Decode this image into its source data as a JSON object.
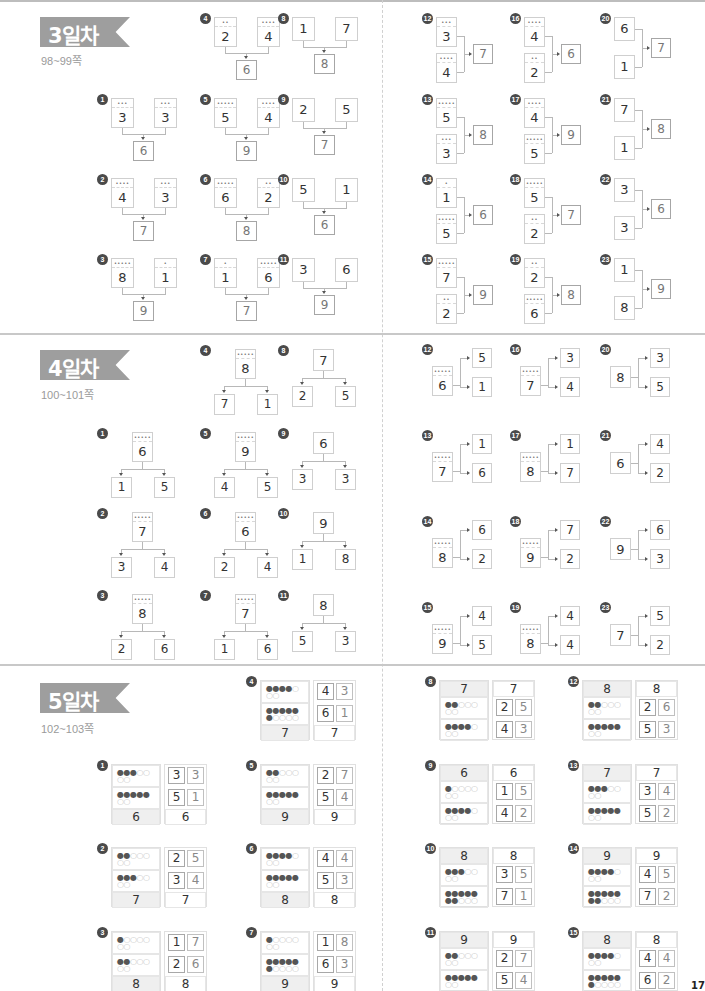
{
  "page": {
    "folio": "17"
  },
  "day3": {
    "title": "3일차",
    "pages": "98~99쪽",
    "problems": [
      {
        "n": "1",
        "a": 3,
        "b": 3,
        "sum": 6
      },
      {
        "n": "2",
        "a": 4,
        "b": 3,
        "sum": 7
      },
      {
        "n": "3",
        "a": 8,
        "b": 1,
        "sum": 9
      },
      {
        "n": "4",
        "a": 2,
        "b": 4,
        "sum": 6
      },
      {
        "n": "5",
        "a": 5,
        "b": 4,
        "sum": 9
      },
      {
        "n": "6",
        "a": 6,
        "b": 2,
        "sum": 8
      },
      {
        "n": "7",
        "a": 1,
        "b": 6,
        "sum": 7
      },
      {
        "n": "8",
        "a": 1,
        "b": 7,
        "sum": 8
      },
      {
        "n": "9",
        "a": 2,
        "b": 5,
        "sum": 7
      },
      {
        "n": "10",
        "a": 5,
        "b": 1,
        "sum": 6
      },
      {
        "n": "11",
        "a": 3,
        "b": 6,
        "sum": 9
      },
      {
        "n": "12",
        "a": 3,
        "b": 4,
        "sum": 7
      },
      {
        "n": "13",
        "a": 5,
        "b": 3,
        "sum": 8
      },
      {
        "n": "14",
        "a": 1,
        "b": 5,
        "sum": 6
      },
      {
        "n": "15",
        "a": 7,
        "b": 2,
        "sum": 9
      },
      {
        "n": "16",
        "a": 4,
        "b": 2,
        "sum": 6
      },
      {
        "n": "17",
        "a": 4,
        "b": 5,
        "sum": 9
      },
      {
        "n": "18",
        "a": 5,
        "b": 2,
        "sum": 7
      },
      {
        "n": "19",
        "a": 2,
        "b": 6,
        "sum": 8
      },
      {
        "n": "20",
        "a": 6,
        "b": 1,
        "sum": 7
      },
      {
        "n": "21",
        "a": 7,
        "b": 1,
        "sum": 8
      },
      {
        "n": "22",
        "a": 3,
        "b": 3,
        "sum": 6
      },
      {
        "n": "23",
        "a": 1,
        "b": 8,
        "sum": 9
      }
    ]
  },
  "day4": {
    "title": "4일차",
    "pages": "100~101쪽",
    "problems": [
      {
        "n": "1",
        "whole": 6,
        "a": 1,
        "b": 5
      },
      {
        "n": "2",
        "whole": 7,
        "a": 3,
        "b": 4
      },
      {
        "n": "3",
        "whole": 8,
        "a": 2,
        "b": 6
      },
      {
        "n": "4",
        "whole": 8,
        "a": 7,
        "b": 1
      },
      {
        "n": "5",
        "whole": 9,
        "a": 4,
        "b": 5
      },
      {
        "n": "6",
        "whole": 6,
        "a": 2,
        "b": 4
      },
      {
        "n": "7",
        "whole": 7,
        "a": 1,
        "b": 6
      },
      {
        "n": "8",
        "whole": 7,
        "a": 2,
        "b": 5
      },
      {
        "n": "9",
        "whole": 6,
        "a": 3,
        "b": 3
      },
      {
        "n": "10",
        "whole": 9,
        "a": 1,
        "b": 8
      },
      {
        "n": "11",
        "whole": 8,
        "a": 5,
        "b": 3
      },
      {
        "n": "12",
        "whole": 6,
        "a": 5,
        "b": 1
      },
      {
        "n": "13",
        "whole": 7,
        "a": 1,
        "b": 6
      },
      {
        "n": "14",
        "whole": 8,
        "a": 6,
        "b": 2
      },
      {
        "n": "15",
        "whole": 9,
        "a": 4,
        "b": 5
      },
      {
        "n": "16",
        "whole": 7,
        "a": 3,
        "b": 4
      },
      {
        "n": "17",
        "whole": 8,
        "a": 1,
        "b": 7
      },
      {
        "n": "18",
        "whole": 9,
        "a": 7,
        "b": 2
      },
      {
        "n": "19",
        "whole": 8,
        "a": 4,
        "b": 4
      },
      {
        "n": "20",
        "whole": 8,
        "a": 3,
        "b": 5
      },
      {
        "n": "21",
        "whole": 6,
        "a": 4,
        "b": 2
      },
      {
        "n": "22",
        "whole": 9,
        "a": 6,
        "b": 3
      },
      {
        "n": "23",
        "whole": 7,
        "a": 5,
        "b": 2
      }
    ]
  },
  "day5": {
    "title": "5일차",
    "pages": "102~103쪽",
    "problems": [
      {
        "n": "1",
        "total": 6,
        "rows": [
          {
            "filled": 3,
            "pair": [
              3,
              3
            ]
          },
          {
            "filled": 5,
            "pair": [
              5,
              1
            ]
          }
        ]
      },
      {
        "n": "2",
        "total": 7,
        "rows": [
          {
            "filled": 2,
            "pair": [
              2,
              5
            ]
          },
          {
            "filled": 3,
            "pair": [
              3,
              4
            ]
          }
        ]
      },
      {
        "n": "3",
        "total": 8,
        "rows": [
          {
            "filled": 1,
            "pair": [
              1,
              7
            ]
          },
          {
            "filled": 2,
            "pair": [
              2,
              6
            ]
          }
        ]
      },
      {
        "n": "4",
        "total": 7,
        "rows": [
          {
            "filled": 4,
            "pair": [
              4,
              3
            ]
          },
          {
            "filled": 6,
            "pair": [
              6,
              1
            ]
          }
        ]
      },
      {
        "n": "5",
        "total": 9,
        "rows": [
          {
            "filled": 2,
            "pair": [
              2,
              7
            ]
          },
          {
            "filled": 5,
            "pair": [
              5,
              4
            ]
          }
        ]
      },
      {
        "n": "6",
        "total": 8,
        "rows": [
          {
            "filled": 4,
            "pair": [
              4,
              4
            ]
          },
          {
            "filled": 5,
            "pair": [
              5,
              3
            ]
          }
        ]
      },
      {
        "n": "7",
        "total": 9,
        "rows": [
          {
            "filled": 1,
            "pair": [
              1,
              8
            ]
          },
          {
            "filled": 6,
            "pair": [
              6,
              3
            ]
          }
        ]
      },
      {
        "n": "8",
        "total": 7,
        "rows": [
          {
            "filled": 2,
            "pair": [
              2,
              5
            ]
          },
          {
            "filled": 4,
            "pair": [
              4,
              3
            ]
          }
        ]
      },
      {
        "n": "9",
        "total": 6,
        "rows": [
          {
            "filled": 1,
            "pair": [
              1,
              5
            ]
          },
          {
            "filled": 4,
            "pair": [
              4,
              2
            ]
          }
        ]
      },
      {
        "n": "10",
        "total": 8,
        "rows": [
          {
            "filled": 3,
            "pair": [
              3,
              5
            ]
          },
          {
            "filled": 7,
            "pair": [
              7,
              1
            ]
          }
        ]
      },
      {
        "n": "11",
        "total": 9,
        "rows": [
          {
            "filled": 2,
            "pair": [
              2,
              7
            ]
          },
          {
            "filled": 5,
            "pair": [
              5,
              4
            ]
          }
        ]
      },
      {
        "n": "12",
        "total": 8,
        "rows": [
          {
            "filled": 2,
            "pair": [
              2,
              6
            ]
          },
          {
            "filled": 5,
            "pair": [
              5,
              3
            ]
          }
        ]
      },
      {
        "n": "13",
        "total": 7,
        "rows": [
          {
            "filled": 3,
            "pair": [
              3,
              4
            ]
          },
          {
            "filled": 5,
            "pair": [
              5,
              2
            ]
          }
        ]
      },
      {
        "n": "14",
        "total": 9,
        "rows": [
          {
            "filled": 4,
            "pair": [
              4,
              5
            ]
          },
          {
            "filled": 7,
            "pair": [
              7,
              2
            ]
          }
        ]
      },
      {
        "n": "15",
        "total": 8,
        "rows": [
          {
            "filled": 4,
            "pair": [
              4,
              4
            ]
          },
          {
            "filled": 6,
            "pair": [
              6,
              2
            ]
          }
        ]
      }
    ]
  },
  "colors": {
    "badge": "#9e9e9e",
    "number_badge": "#4a4a4a",
    "dot_filled": "#555555",
    "dot_empty": "#c9c9c9",
    "footer_fill": "#efefef"
  }
}
